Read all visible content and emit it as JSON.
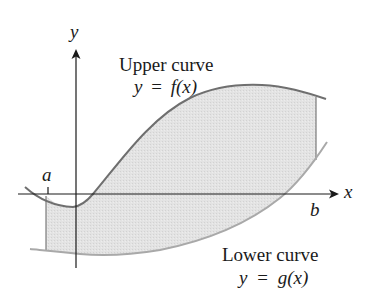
{
  "figure": {
    "axes": {
      "x_label": "x",
      "y_label": "y"
    },
    "bounds": {
      "left_label": "a",
      "right_label": "b"
    },
    "upper_curve": {
      "title": "Upper curve",
      "equation_lhs": "y",
      "equation_eq": "=",
      "equation_rhs": "f(x)"
    },
    "lower_curve": {
      "title": "Lower curve",
      "equation_lhs": "y",
      "equation_eq": "=",
      "equation_rhs": "g(x)"
    },
    "colors": {
      "shading": "#e2e2e2",
      "curve": "#6f6f6f",
      "axis": "#1a1a1a",
      "bound_line": "#7a7a7a"
    }
  }
}
